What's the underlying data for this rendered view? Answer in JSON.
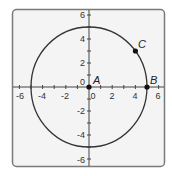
{
  "diagram": {
    "type": "coordinate-plane-circle",
    "x_axis": {
      "min": -6,
      "max": 6,
      "tick_labels": [
        "-6",
        "-4",
        "-2",
        "0",
        "2",
        "4",
        "6"
      ]
    },
    "y_axis": {
      "min": -6,
      "max": 6,
      "tick_labels": [
        "6",
        "4",
        "2",
        "0",
        "-2",
        "-4",
        "-6"
      ]
    },
    "circle": {
      "center": [
        0,
        0
      ],
      "radius": 5
    },
    "points": [
      {
        "label": "A",
        "x": 0,
        "y": 0
      },
      {
        "label": "B",
        "x": 5,
        "y": 0
      },
      {
        "label": "C",
        "x": 4,
        "y": 3
      }
    ],
    "colors": {
      "frame_border": "#7a7a7a",
      "background": "#f4f4f4",
      "axis": "#444444",
      "circle": "#333333",
      "point": "#111111"
    }
  }
}
